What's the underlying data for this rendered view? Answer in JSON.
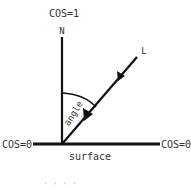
{
  "diagram": {
    "type": "lighting-angle-diagram",
    "labels": {
      "cos_top": "COS=1",
      "normal": "N",
      "light": "L",
      "angle": "angle",
      "cos_left": "COS=0",
      "cos_right": "COS=0",
      "surface": "surface",
      "bottom_partial": "' ' ' '"
    },
    "colors": {
      "stroke": "#111111",
      "text": "#333333"
    }
  }
}
